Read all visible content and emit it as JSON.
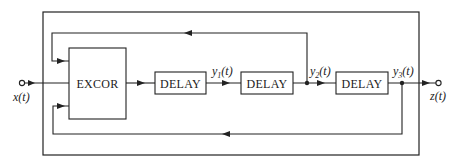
{
  "diagram": {
    "blocks": {
      "excor": {
        "label": "EXCOR"
      },
      "delay1": {
        "label": "DELAY"
      },
      "delay2": {
        "label": "DELAY"
      },
      "delay3": {
        "label": "DELAY"
      }
    },
    "signals": {
      "input": "x(t)",
      "y1": "y",
      "y1_sub": "1",
      "y1_arg": "(t)",
      "y2": "y",
      "y2_sub": "2",
      "y2_arg": "(t)",
      "y3": "y",
      "y3_sub": "3",
      "y3_arg": "(t)",
      "output": "z(t)"
    },
    "colors": {
      "line": "#222222",
      "background": "#ffffff"
    }
  }
}
